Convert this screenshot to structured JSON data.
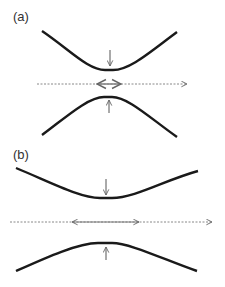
{
  "panels": [
    {
      "label": "(a)",
      "description": "narrow gap between curves; short double arrow"
    },
    {
      "label": "(b)",
      "description": "wider gap between curves; long double arrow"
    }
  ],
  "colors": {
    "curve": "#1a1a1a",
    "arrow": "#555555",
    "double_arrow": "#888888",
    "dashed": "#888888"
  }
}
